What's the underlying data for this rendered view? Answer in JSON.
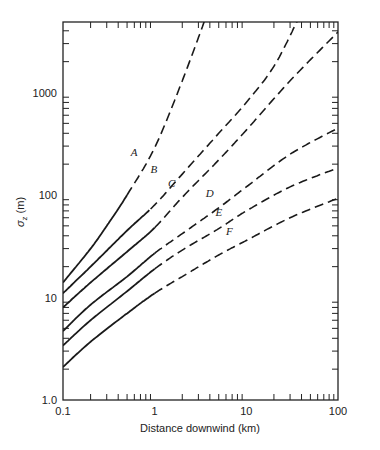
{
  "chart_data": {
    "type": "line",
    "title": "",
    "xlabel": "Distance downwind (km)",
    "ylabel": "σz (m)",
    "xscale": "log",
    "yscale": "log",
    "xlim": [
      0.1,
      100
    ],
    "ylim": [
      1.0,
      5000
    ],
    "x_ticks": [
      "0.1",
      "1",
      "10",
      "100"
    ],
    "y_ticks": [
      "1.0",
      "10",
      "100",
      "1000"
    ],
    "grid": false,
    "legend": "inline curve labels",
    "series": [
      {
        "name": "A",
        "style": "solid then dashed",
        "solid_until": 0.5,
        "points": [
          [
            0.1,
            14
          ],
          [
            0.2,
            30
          ],
          [
            0.3,
            50
          ],
          [
            0.5,
            100
          ],
          [
            1,
            290
          ],
          [
            2,
            1300
          ],
          [
            3.5,
            5000
          ]
        ]
      },
      {
        "name": "B",
        "style": "solid then dashed",
        "solid_until": 0.9,
        "points": [
          [
            0.1,
            11
          ],
          [
            0.2,
            20
          ],
          [
            0.5,
            45
          ],
          [
            1,
            80
          ],
          [
            2,
            160
          ],
          [
            5,
            400
          ],
          [
            10,
            800
          ],
          [
            20,
            1800
          ],
          [
            36,
            5000
          ]
        ]
      },
      {
        "name": "C",
        "style": "solid then dashed",
        "solid_until": 1.0,
        "points": [
          [
            0.1,
            8
          ],
          [
            0.2,
            14
          ],
          [
            0.5,
            28
          ],
          [
            1,
            48
          ],
          [
            2,
            95
          ],
          [
            5,
            220
          ],
          [
            10,
            430
          ],
          [
            30,
            1300
          ],
          [
            100,
            3900
          ]
        ]
      },
      {
        "name": "D",
        "style": "solid then dashed",
        "solid_until": 1.0,
        "points": [
          [
            0.1,
            4.7
          ],
          [
            0.2,
            8.5
          ],
          [
            0.5,
            16
          ],
          [
            1,
            27
          ],
          [
            2,
            42
          ],
          [
            5,
            75
          ],
          [
            10,
            120
          ],
          [
            30,
            250
          ],
          [
            100,
            450
          ]
        ]
      },
      {
        "name": "E",
        "style": "solid then dashed",
        "solid_until": 1.0,
        "points": [
          [
            0.1,
            3.4
          ],
          [
            0.2,
            6
          ],
          [
            0.5,
            11.5
          ],
          [
            1,
            19
          ],
          [
            2,
            29
          ],
          [
            5,
            47
          ],
          [
            10,
            70
          ],
          [
            30,
            120
          ],
          [
            100,
            184
          ]
        ]
      },
      {
        "name": "F",
        "style": "solid then dashed",
        "solid_until": 1.0,
        "points": [
          [
            0.1,
            2.1
          ],
          [
            0.2,
            3.7
          ],
          [
            0.5,
            7
          ],
          [
            1,
            11
          ],
          [
            2,
            16
          ],
          [
            5,
            26
          ],
          [
            10,
            36
          ],
          [
            30,
            60
          ],
          [
            100,
            93
          ]
        ]
      }
    ],
    "annotations": [
      {
        "text": "A",
        "x": 0.55,
        "y": 240
      },
      {
        "text": "B",
        "x": 0.9,
        "y": 165
      },
      {
        "text": "C",
        "x": 1.4,
        "y": 120
      },
      {
        "text": "D",
        "x": 3.6,
        "y": 95
      },
      {
        "text": "E",
        "x": 4.6,
        "y": 63
      },
      {
        "text": "F",
        "x": 6.0,
        "y": 41
      }
    ]
  },
  "axes": {
    "x_label": "Distance downwind (km)",
    "y_label_main": "σ",
    "y_label_sub": "z",
    "y_label_unit": "(m)"
  }
}
